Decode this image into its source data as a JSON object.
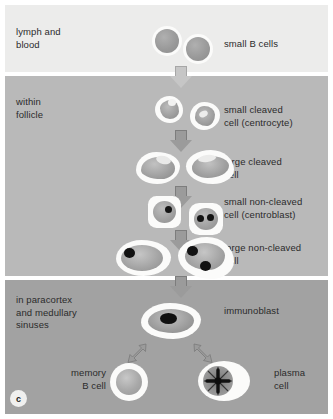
{
  "figure": {
    "panel_letter": "c",
    "bands": [
      {
        "id": "lymph",
        "compartment_label": "lymph and\nblood"
      },
      {
        "id": "follicle",
        "compartment_label": "within\nfollicle"
      },
      {
        "id": "paracortex",
        "compartment_label": "in paracortex\nand medullary\nsinuses"
      }
    ],
    "stages": [
      {
        "id": "small-b-cells",
        "label": "small B cells"
      },
      {
        "id": "small-cleaved",
        "label": "small cleaved\ncell (centrocyte)"
      },
      {
        "id": "large-cleaved",
        "label": "large cleaved\ncell"
      },
      {
        "id": "small-non-cleaved",
        "label": "small non-cleaved\ncell (centroblast)"
      },
      {
        "id": "large-non-cleaved",
        "label": "large non-cleaved\ncell"
      },
      {
        "id": "immunoblast",
        "label": "immunoblast"
      },
      {
        "id": "memory-b-cell",
        "label": "memory\nB cell"
      },
      {
        "id": "plasma-cell",
        "label": "plasma\ncell"
      }
    ],
    "colors": {
      "band_lymph": "#ececeb",
      "band_follicle": "#b9b9b9",
      "band_paracortex": "#a2a2a2",
      "cytoplasm": "#fbfbfa",
      "nucleus": "#9a9a9a",
      "nucleolus": "#141414",
      "arrow": "#9b9b9b",
      "text": "#2b2b2b"
    }
  }
}
